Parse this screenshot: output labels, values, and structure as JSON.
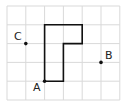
{
  "grid": {
    "columns": 6,
    "rows": 5,
    "origin_px": [
      7,
      6
    ],
    "cell_px": 18.8,
    "line_color": "#d9d9d9"
  },
  "shape": {
    "description": "L-shaped polygon on grid",
    "vertices_grid": [
      [
        2,
        4
      ],
      [
        2,
        1
      ],
      [
        4,
        1
      ],
      [
        4,
        2
      ],
      [
        3,
        2
      ],
      [
        3,
        4
      ]
    ],
    "stroke": "#111111"
  },
  "points": [
    {
      "label": "A",
      "grid": [
        2,
        4
      ]
    },
    {
      "label": "B",
      "grid": [
        5,
        3
      ]
    },
    {
      "label": "C",
      "grid": [
        1,
        2
      ]
    }
  ],
  "labels": {
    "a": "A",
    "b": "B",
    "c": "C"
  }
}
